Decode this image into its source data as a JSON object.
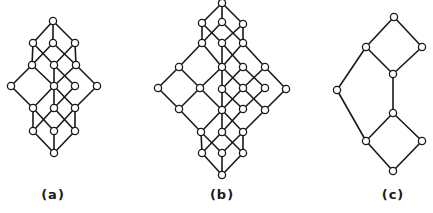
{
  "figure": {
    "background": "#ffffff",
    "line_color": "#1a1a1a",
    "node_radius": 3.6,
    "diagrams": [
      {
        "id": "a",
        "label": "(a)",
        "label_pos": [
          53,
          198
        ],
        "nodes": [
          [
            53,
            21
          ],
          [
            33,
            43
          ],
          [
            53,
            43
          ],
          [
            75,
            43
          ],
          [
            32,
            65
          ],
          [
            54,
            65
          ],
          [
            76,
            65
          ],
          [
            11,
            86
          ],
          [
            54,
            86
          ],
          [
            75,
            86
          ],
          [
            97,
            86
          ],
          [
            33,
            108
          ],
          [
            54,
            108
          ],
          [
            75,
            108
          ],
          [
            33,
            131
          ],
          [
            54,
            131
          ],
          [
            75,
            131
          ],
          [
            54,
            153
          ]
        ],
        "edges": [
          [
            0,
            1
          ],
          [
            0,
            2
          ],
          [
            0,
            3
          ],
          [
            1,
            4
          ],
          [
            1,
            5
          ],
          [
            2,
            4
          ],
          [
            2,
            6
          ],
          [
            3,
            5
          ],
          [
            3,
            6
          ],
          [
            4,
            7
          ],
          [
            4,
            8
          ],
          [
            5,
            8
          ],
          [
            5,
            9
          ],
          [
            6,
            8
          ],
          [
            6,
            10
          ],
          [
            7,
            11
          ],
          [
            8,
            11
          ],
          [
            8,
            12
          ],
          [
            8,
            13
          ],
          [
            9,
            12
          ],
          [
            10,
            13
          ],
          [
            11,
            14
          ],
          [
            11,
            15
          ],
          [
            12,
            14
          ],
          [
            12,
            16
          ],
          [
            13,
            15
          ],
          [
            13,
            16
          ],
          [
            14,
            17
          ],
          [
            15,
            17
          ],
          [
            16,
            17
          ]
        ]
      },
      {
        "id": "b",
        "label": "(b)",
        "label_pos": [
          222,
          198
        ],
        "nodes": [
          [
            222,
            3
          ],
          [
            202,
            23
          ],
          [
            222,
            22
          ],
          [
            243,
            24
          ],
          [
            202,
            43
          ],
          [
            222,
            43
          ],
          [
            243,
            43
          ],
          [
            179,
            67
          ],
          [
            222,
            67
          ],
          [
            243,
            67
          ],
          [
            265,
            67
          ],
          [
            158,
            88
          ],
          [
            200,
            88
          ],
          [
            222,
            89
          ],
          [
            243,
            88
          ],
          [
            265,
            88
          ],
          [
            286,
            89
          ],
          [
            179,
            109
          ],
          [
            222,
            110
          ],
          [
            243,
            109
          ],
          [
            265,
            110
          ],
          [
            201,
            132
          ],
          [
            222,
            132
          ],
          [
            243,
            132
          ],
          [
            202,
            153
          ],
          [
            222,
            153
          ],
          [
            243,
            153
          ],
          [
            222,
            175
          ]
        ],
        "edges": [
          [
            0,
            1
          ],
          [
            0,
            2
          ],
          [
            0,
            3
          ],
          [
            1,
            4
          ],
          [
            1,
            5
          ],
          [
            2,
            4
          ],
          [
            2,
            6
          ],
          [
            3,
            5
          ],
          [
            3,
            6
          ],
          [
            4,
            7
          ],
          [
            4,
            8
          ],
          [
            5,
            8
          ],
          [
            5,
            9
          ],
          [
            6,
            8
          ],
          [
            6,
            10
          ],
          [
            7,
            11
          ],
          [
            7,
            12
          ],
          [
            8,
            12
          ],
          [
            8,
            13
          ],
          [
            8,
            14
          ],
          [
            9,
            13
          ],
          [
            9,
            15
          ],
          [
            10,
            14
          ],
          [
            10,
            16
          ],
          [
            11,
            17
          ],
          [
            12,
            17
          ],
          [
            12,
            18
          ],
          [
            13,
            18
          ],
          [
            13,
            19
          ],
          [
            14,
            18
          ],
          [
            14,
            20
          ],
          [
            15,
            19
          ],
          [
            16,
            20
          ],
          [
            17,
            21
          ],
          [
            18,
            21
          ],
          [
            18,
            22
          ],
          [
            18,
            23
          ],
          [
            19,
            22
          ],
          [
            20,
            23
          ],
          [
            21,
            24
          ],
          [
            21,
            25
          ],
          [
            22,
            24
          ],
          [
            22,
            26
          ],
          [
            23,
            25
          ],
          [
            23,
            26
          ],
          [
            24,
            27
          ],
          [
            25,
            27
          ],
          [
            26,
            27
          ]
        ]
      },
      {
        "id": "c",
        "label": "(c)",
        "label_pos": [
          393,
          198
        ],
        "nodes": [
          [
            394,
            17
          ],
          [
            366,
            47
          ],
          [
            422,
            47
          ],
          [
            393,
            74
          ],
          [
            337,
            90
          ],
          [
            393,
            113
          ],
          [
            366,
            141
          ],
          [
            422,
            141
          ],
          [
            393,
            171
          ]
        ],
        "edges": [
          [
            0,
            1
          ],
          [
            0,
            2
          ],
          [
            1,
            3
          ],
          [
            2,
            3
          ],
          [
            1,
            4
          ],
          [
            3,
            5
          ],
          [
            4,
            6
          ],
          [
            5,
            6
          ],
          [
            5,
            7
          ],
          [
            6,
            8
          ],
          [
            7,
            8
          ]
        ]
      }
    ]
  }
}
